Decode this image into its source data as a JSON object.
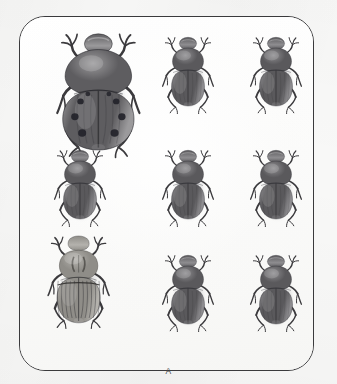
{
  "plate": {
    "label": "A",
    "border_color": "#3a3a3c",
    "background_color": "#fdfdfc",
    "page_background_color": "#f8f8f7",
    "corner_radius_px": 26,
    "frame": {
      "x": 19,
      "y": 16,
      "width": 295,
      "height": 355
    }
  },
  "figure": {
    "kind": "museum-specimen-plate",
    "view": "dorsal",
    "layout": {
      "rows": 3,
      "columns": 3,
      "total_specimens": 9
    }
  },
  "specimens": [
    {
      "id": "specimen-r1c1",
      "row": 1,
      "column": 1,
      "morph": "spotted-large",
      "scale": 1.62,
      "x": 53,
      "y": 22,
      "body_color": "#5e5d60",
      "body_color_light": "#9b9a9c",
      "spot_color": "#23232a",
      "spot_count": 6,
      "has_spots": true,
      "notes": "largest specimen, broad rounded elytra with six dark maculae"
    },
    {
      "id": "specimen-r1c2",
      "row": 1,
      "column": 2,
      "morph": "plain-dark",
      "scale": 1.0,
      "x": 160,
      "y": 30,
      "body_color": "#5a595c",
      "body_color_light": "#8e8d90",
      "spot_color": "#2a2a30",
      "spot_count": 0,
      "has_spots": false,
      "notes": "typical dark dung-beetle habitus"
    },
    {
      "id": "specimen-r1c3",
      "row": 1,
      "column": 3,
      "morph": "plain-dark",
      "scale": 1.0,
      "x": 248,
      "y": 30,
      "body_color": "#5a595c",
      "body_color_light": "#8e8d90",
      "spot_color": "#2a2a30",
      "spot_count": 0,
      "has_spots": false,
      "notes": "typical dark dung-beetle habitus"
    },
    {
      "id": "specimen-r2c1",
      "row": 2,
      "column": 1,
      "morph": "plain-dark",
      "scale": 1.0,
      "x": 52,
      "y": 143,
      "body_color": "#5a595c",
      "body_color_light": "#8e8d90",
      "spot_color": "#2a2a30",
      "spot_count": 0,
      "has_spots": false,
      "notes": "typical dark dung-beetle habitus"
    },
    {
      "id": "specimen-r2c2",
      "row": 2,
      "column": 2,
      "morph": "plain-dark",
      "scale": 1.0,
      "x": 160,
      "y": 143,
      "body_color": "#5a595c",
      "body_color_light": "#8e8d90",
      "spot_color": "#2a2a30",
      "spot_count": 0,
      "has_spots": false,
      "notes": "typical dark dung-beetle habitus"
    },
    {
      "id": "specimen-r2c3",
      "row": 2,
      "column": 3,
      "morph": "plain-dark",
      "scale": 1.0,
      "x": 248,
      "y": 143,
      "body_color": "#5a595c",
      "body_color_light": "#8e8d90",
      "spot_color": "#2a2a30",
      "spot_count": 0,
      "has_spots": false,
      "notes": "typical dark dung-beetle habitus"
    },
    {
      "id": "specimen-r3c1",
      "row": 3,
      "column": 1,
      "morph": "pale-striate",
      "scale": 1.2,
      "x": 45,
      "y": 228,
      "body_color": "#8f8d88",
      "body_color_light": "#b4b2ad",
      "spot_color": "#4c4a47",
      "spot_count": 0,
      "has_spots": false,
      "notes": "paler grey-brown specimen with longitudinally striate elytra and clypeal horns"
    },
    {
      "id": "specimen-r3c2",
      "row": 3,
      "column": 2,
      "morph": "plain-dark",
      "scale": 1.0,
      "x": 160,
      "y": 248,
      "body_color": "#5a595c",
      "body_color_light": "#8e8d90",
      "spot_color": "#2a2a30",
      "spot_count": 0,
      "has_spots": false,
      "notes": "typical dark dung-beetle habitus"
    },
    {
      "id": "specimen-r3c3",
      "row": 3,
      "column": 3,
      "morph": "plain-dark",
      "scale": 1.0,
      "x": 248,
      "y": 248,
      "body_color": "#5a595c",
      "body_color_light": "#8e8d90",
      "spot_color": "#2a2a30",
      "spot_count": 0,
      "has_spots": false,
      "notes": "typical dark dung-beetle habitus"
    }
  ]
}
